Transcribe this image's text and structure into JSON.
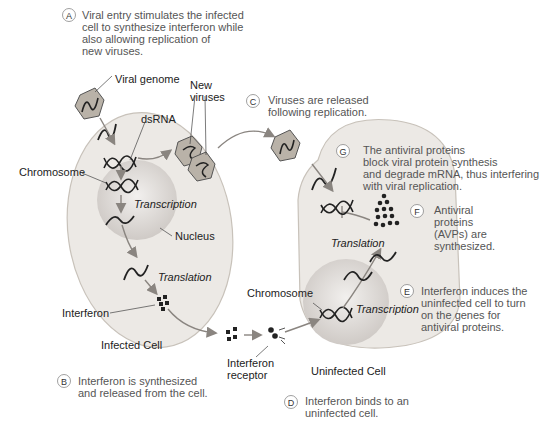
{
  "colors": {
    "cell_fill": "#ece9e5",
    "cell_stroke": "#c8c2ba",
    "nucleus_fill": "#d6d2cf",
    "virus_fill": "#b9b2a8",
    "arrow": "#8a8580",
    "text": "#222222",
    "caption_text": "#555555"
  },
  "steps": [
    {
      "letter": "A",
      "lines": [
        "Viral entry stimulates the infected",
        "cell to synthesize interferon while",
        "also allowing replication of",
        "new viruses."
      ]
    },
    {
      "letter": "B",
      "lines": [
        "Interferon is synthesized",
        "and released from the cell."
      ]
    },
    {
      "letter": "C",
      "lines": [
        "Viruses are released",
        "following replication."
      ]
    },
    {
      "letter": "D",
      "lines": [
        "Interferon binds to an",
        "uninfected cell."
      ]
    },
    {
      "letter": "E",
      "lines": [
        "Interferon induces the",
        "uninfected cell to turn",
        "on the genes for",
        "antiviral proteins."
      ]
    },
    {
      "letter": "F",
      "lines": [
        "Antiviral",
        "proteins",
        "(AVPs) are",
        "synthesized."
      ]
    },
    {
      "letter": "G",
      "lines": [
        "The antiviral proteins",
        "block viral protein synthesis",
        "and degrade mRNA, thus interfering",
        "with viral replication."
      ]
    }
  ],
  "labels": {
    "viral_genome": "Viral genome",
    "new_viruses_1": "New",
    "new_viruses_2": "viruses",
    "dsrna": "dsRNA",
    "chromosome_left": "Chromosome",
    "transcription_left": "Transcription",
    "nucleus": "Nucleus",
    "translation_left": "Translation",
    "interferon": "Interferon",
    "infected_cell": "Infected Cell",
    "interferon_receptor_1": "Interferon",
    "interferon_receptor_2": "receptor",
    "uninfected_cell": "Uninfected Cell",
    "chromosome_right": "Chromosome",
    "transcription_right": "Transcription",
    "translation_right": "Translation"
  }
}
